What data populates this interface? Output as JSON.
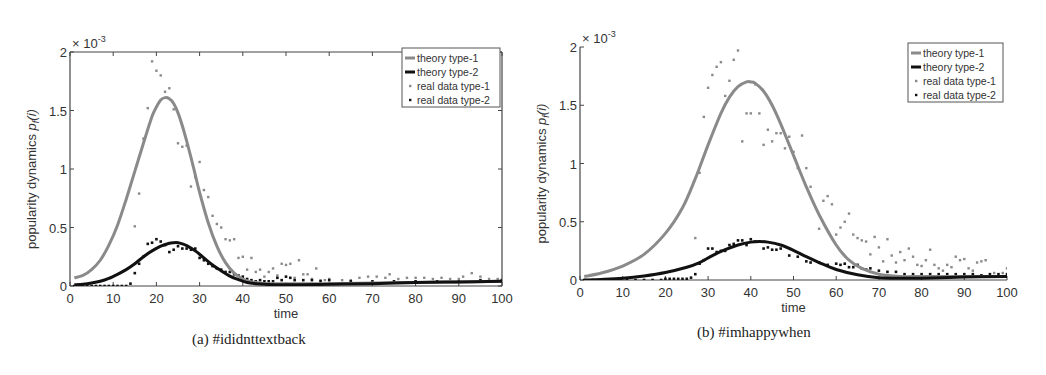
{
  "chart_data": [
    {
      "id": "a",
      "type": "line",
      "caption": "(a)  #ididnttextback",
      "title": "",
      "xlabel": "time",
      "ylabel": "popularity dynamics p_f(i)",
      "ylabel_main": "popularity dynamics ",
      "ylabel_symbol": "p",
      "ylabel_sub": "f",
      "ylabel_arg": "(i)",
      "y_multiplier": "× 10",
      "y_multiplier_exp": "-3",
      "xlim": [
        0,
        100
      ],
      "ylim": [
        0,
        2
      ],
      "xticks": [
        0,
        10,
        20,
        30,
        40,
        50,
        60,
        70,
        80,
        90,
        100
      ],
      "yticks": [
        0,
        0.5,
        1,
        1.5,
        2
      ],
      "ytick_labels": [
        "0",
        "0.5",
        "1",
        "1.5",
        "2"
      ],
      "grid": false,
      "box": true,
      "legend_position": "upper right",
      "legend": [
        {
          "label": "theory type-1",
          "kind": "line",
          "color": "#8a8a8a"
        },
        {
          "label": "theory type-2",
          "kind": "line",
          "color": "#111111"
        },
        {
          "label": "real data type-1",
          "kind": "marker",
          "color": "#8a8a8a"
        },
        {
          "label": "real data type-2",
          "kind": "marker",
          "color": "#111111"
        }
      ],
      "series": [
        {
          "name": "theory type-1",
          "kind": "line",
          "color": "#8a8a8a",
          "width": 3,
          "x": [
            1,
            3,
            5,
            7,
            9,
            11,
            13,
            15,
            17,
            19,
            20,
            21,
            22,
            23,
            24,
            25,
            26,
            27,
            28,
            29,
            30,
            32,
            34,
            36,
            38,
            40,
            42,
            44,
            46,
            50,
            60,
            70,
            80,
            90,
            100
          ],
          "values": [
            0.07,
            0.09,
            0.14,
            0.22,
            0.35,
            0.52,
            0.74,
            0.98,
            1.22,
            1.45,
            1.53,
            1.59,
            1.61,
            1.6,
            1.56,
            1.48,
            1.37,
            1.24,
            1.1,
            0.95,
            0.8,
            0.54,
            0.34,
            0.2,
            0.11,
            0.06,
            0.035,
            0.025,
            0.02,
            0.02,
            0.02,
            0.025,
            0.03,
            0.035,
            0.04
          ]
        },
        {
          "name": "theory type-2",
          "kind": "line",
          "color": "#111111",
          "width": 3,
          "x": [
            1,
            3,
            5,
            7,
            9,
            11,
            13,
            15,
            17,
            19,
            21,
            23,
            24,
            25,
            26,
            27,
            29,
            31,
            33,
            35,
            37,
            39,
            41,
            43,
            45,
            50,
            60,
            70,
            80,
            90,
            100
          ],
          "values": [
            0.01,
            0.015,
            0.025,
            0.04,
            0.065,
            0.1,
            0.14,
            0.19,
            0.25,
            0.3,
            0.34,
            0.365,
            0.37,
            0.37,
            0.36,
            0.345,
            0.3,
            0.24,
            0.18,
            0.13,
            0.085,
            0.055,
            0.03,
            0.02,
            0.015,
            0.01,
            0.015,
            0.02,
            0.03,
            0.035,
            0.04
          ]
        },
        {
          "name": "real data type-1",
          "kind": "scatter",
          "color": "#8a8a8a",
          "x": [
            15,
            16,
            17,
            18,
            19,
            20,
            21,
            22,
            23,
            24,
            25,
            26,
            27,
            28,
            29,
            30,
            31,
            32,
            33,
            34,
            35,
            36,
            37,
            38,
            39,
            40,
            41,
            42,
            43,
            44,
            45,
            46,
            47,
            48,
            49,
            50,
            51,
            52,
            53,
            54,
            55,
            56,
            57,
            58,
            59,
            60,
            63,
            65,
            67,
            69,
            71,
            73,
            74,
            76,
            78,
            80,
            82,
            84,
            86,
            88,
            90,
            91,
            93,
            95,
            97,
            99,
            100
          ],
          "values": [
            0.51,
            0.79,
            1.26,
            1.52,
            1.92,
            1.84,
            1.8,
            1.66,
            1.69,
            1.51,
            1.22,
            1.19,
            1.2,
            0.85,
            0.93,
            1.06,
            0.82,
            0.76,
            0.6,
            0.53,
            0.5,
            0.4,
            0.39,
            0.4,
            0.24,
            0.25,
            0.14,
            0.24,
            0.12,
            0.14,
            0.08,
            0.12,
            0.15,
            0.09,
            0.19,
            0.18,
            0.19,
            0.07,
            0.22,
            0.1,
            0.1,
            0.06,
            0.15,
            0.05,
            0.05,
            0.06,
            0.05,
            0.05,
            0.07,
            0.08,
            0.08,
            0.07,
            0.1,
            0.06,
            0.07,
            0.07,
            0.07,
            0.06,
            0.07,
            0.06,
            0.06,
            0.08,
            0.11,
            0.08,
            0.06,
            0.06,
            0.06
          ]
        },
        {
          "name": "real data type-2",
          "kind": "scatter",
          "color": "#111111",
          "x": [
            1,
            2,
            3,
            4,
            5,
            6,
            7,
            8,
            9,
            10,
            11,
            12,
            13,
            14,
            15,
            16,
            17,
            18,
            19,
            20,
            21,
            22,
            23,
            24,
            25,
            26,
            27,
            28,
            29,
            30,
            31,
            32,
            33,
            34,
            35,
            36,
            37,
            38,
            39,
            40,
            41,
            42,
            43,
            44,
            45,
            46,
            47,
            48,
            49,
            50,
            51,
            52,
            54,
            56,
            58,
            60,
            65,
            70,
            75,
            80,
            85,
            90,
            95,
            100
          ],
          "values": [
            0.0,
            0.0,
            0.0,
            0.0,
            0.0,
            0.0,
            0.0,
            0.0,
            0.0,
            0.0,
            0.0,
            0.0,
            0.0,
            0.02,
            0.11,
            0.19,
            0.25,
            0.36,
            0.37,
            0.4,
            0.38,
            0.35,
            0.29,
            0.31,
            0.34,
            0.32,
            0.32,
            0.31,
            0.32,
            0.24,
            0.22,
            0.19,
            0.17,
            0.15,
            0.14,
            0.12,
            0.12,
            0.1,
            0.09,
            0.08,
            0.06,
            0.05,
            0.04,
            0.05,
            0.04,
            0.04,
            0.04,
            0.07,
            0.05,
            0.08,
            0.07,
            0.05,
            0.05,
            0.05,
            0.04,
            0.05,
            0.04,
            0.04,
            0.04,
            0.04,
            0.04,
            0.04,
            0.05,
            0.05
          ]
        }
      ]
    },
    {
      "id": "b",
      "type": "line",
      "caption": "(b)  #imhappywhen",
      "title": "",
      "xlabel": "time",
      "ylabel": "popularity dynamics p_f(i)",
      "ylabel_main": "popularity dynamics ",
      "ylabel_symbol": "p",
      "ylabel_sub": "f",
      "ylabel_arg": "(i)",
      "y_multiplier": "× 10",
      "y_multiplier_exp": "-3",
      "xlim": [
        0,
        100
      ],
      "ylim": [
        0,
        2
      ],
      "xticks": [
        0,
        10,
        20,
        30,
        40,
        50,
        60,
        70,
        80,
        90,
        100
      ],
      "yticks": [
        0,
        0.5,
        1,
        1.5,
        2
      ],
      "ytick_labels": [
        "0",
        "0.5",
        "1",
        "1.5",
        "2"
      ],
      "grid": false,
      "box": false,
      "legend_position": "upper right",
      "legend": [
        {
          "label": "theory type-1",
          "kind": "line",
          "color": "#8a8a8a"
        },
        {
          "label": "theory type-2",
          "kind": "line",
          "color": "#111111"
        },
        {
          "label": "real data type-1",
          "kind": "marker",
          "color": "#8a8a8a"
        },
        {
          "label": "real data type-2",
          "kind": "marker",
          "color": "#111111"
        }
      ],
      "series": [
        {
          "name": "theory type-1",
          "kind": "line",
          "color": "#8a8a8a",
          "width": 3,
          "x": [
            1,
            5,
            10,
            15,
            20,
            24,
            27,
            30,
            33,
            35,
            37,
            39,
            40,
            41,
            43,
            45,
            47,
            50,
            53,
            56,
            60,
            63,
            66,
            70,
            75,
            80,
            90,
            100
          ],
          "values": [
            0.03,
            0.06,
            0.12,
            0.22,
            0.4,
            0.62,
            0.87,
            1.16,
            1.43,
            1.57,
            1.66,
            1.7,
            1.7,
            1.69,
            1.62,
            1.5,
            1.34,
            1.07,
            0.8,
            0.56,
            0.3,
            0.17,
            0.1,
            0.05,
            0.03,
            0.03,
            0.03,
            0.03
          ]
        },
        {
          "name": "theory type-2",
          "kind": "line",
          "color": "#111111",
          "width": 3,
          "x": [
            1,
            5,
            10,
            15,
            20,
            25,
            28,
            31,
            34,
            37,
            40,
            42,
            44,
            47,
            50,
            53,
            56,
            60,
            65,
            70,
            75,
            80,
            90,
            100
          ],
          "values": [
            0.0,
            0.005,
            0.015,
            0.035,
            0.065,
            0.11,
            0.15,
            0.21,
            0.26,
            0.3,
            0.325,
            0.33,
            0.325,
            0.3,
            0.255,
            0.2,
            0.15,
            0.09,
            0.045,
            0.02,
            0.015,
            0.015,
            0.025,
            0.03
          ]
        },
        {
          "name": "real data type-1",
          "kind": "scatter",
          "color": "#8a8a8a",
          "x": [
            27,
            28,
            29,
            30,
            31,
            32,
            33,
            34,
            35,
            36,
            37,
            38,
            39,
            40,
            41,
            42,
            43,
            44,
            45,
            46,
            47,
            48,
            49,
            50,
            51,
            52,
            53,
            54,
            56,
            57,
            58,
            59,
            60,
            61,
            62,
            63,
            64,
            65,
            66,
            67,
            68,
            69,
            70,
            71,
            72,
            73,
            74,
            75,
            76,
            77,
            78,
            79,
            80,
            81,
            82,
            83,
            84,
            85,
            86,
            87,
            88,
            89,
            90,
            91,
            92,
            93,
            94,
            95,
            97,
            99,
            100
          ],
          "values": [
            0.36,
            0.92,
            1.4,
            1.65,
            1.76,
            1.83,
            1.87,
            1.58,
            1.71,
            1.89,
            1.97,
            1.19,
            1.43,
            1.43,
            1.68,
            1.43,
            1.16,
            1.29,
            1.19,
            1.26,
            1.26,
            1.13,
            1.23,
            1.1,
            0.96,
            1.24,
            0.96,
            0.8,
            0.44,
            0.68,
            0.72,
            0.65,
            0.39,
            0.45,
            0.5,
            0.57,
            0.39,
            0.36,
            0.34,
            0.33,
            0.22,
            0.37,
            0.28,
            0.16,
            0.35,
            0.21,
            0.15,
            0.24,
            0.17,
            0.27,
            0.2,
            0.13,
            0.12,
            0.17,
            0.26,
            0.13,
            0.1,
            0.08,
            0.13,
            0.11,
            0.2,
            0.17,
            0.18,
            0.1,
            0.08,
            0.15,
            0.16,
            0.17,
            0.06,
            0.06,
            0.1
          ]
        },
        {
          "name": "real data type-2",
          "kind": "scatter",
          "color": "#111111",
          "x": [
            1,
            3,
            5,
            7,
            9,
            11,
            13,
            15,
            17,
            19,
            20,
            21,
            22,
            23,
            24,
            25,
            26,
            27,
            28,
            29,
            30,
            31,
            32,
            33,
            34,
            35,
            36,
            37,
            38,
            39,
            40,
            41,
            43,
            44,
            45,
            46,
            47,
            49,
            51,
            53,
            54,
            56,
            58,
            60,
            61,
            62,
            63,
            64,
            65,
            66,
            67,
            68,
            70,
            72,
            74,
            76,
            78,
            80,
            82,
            84,
            86,
            88,
            90,
            92,
            94,
            96,
            98,
            100
          ],
          "values": [
            0.0,
            0.0,
            0.0,
            0.0,
            0.0,
            0.0,
            0.0,
            0.0,
            0.0,
            0.0,
            0.01,
            0.01,
            0.01,
            0.01,
            0.01,
            0.01,
            0.02,
            0.05,
            0.14,
            0.17,
            0.27,
            0.27,
            0.24,
            0.25,
            0.25,
            0.3,
            0.31,
            0.34,
            0.34,
            0.3,
            0.35,
            0.33,
            0.27,
            0.28,
            0.26,
            0.26,
            0.27,
            0.21,
            0.2,
            0.16,
            0.15,
            0.15,
            0.13,
            0.14,
            0.13,
            0.14,
            0.11,
            0.11,
            0.13,
            0.1,
            0.09,
            0.1,
            0.08,
            0.07,
            0.07,
            0.05,
            0.05,
            0.05,
            0.05,
            0.05,
            0.05,
            0.05,
            0.05,
            0.05,
            0.04,
            0.05,
            0.05,
            0.05
          ]
        }
      ]
    }
  ],
  "layout": {
    "a": {
      "x0": 70,
      "x1": 502,
      "y0": 286,
      "y1": 52,
      "legend": {
        "x": 402,
        "y": 48,
        "w": 98,
        "h": 59
      }
    },
    "b": {
      "x0": 57,
      "x1": 484,
      "y0": 280,
      "y1": 47,
      "legend": {
        "x": 385,
        "y": 43,
        "w": 95,
        "h": 59
      }
    }
  }
}
